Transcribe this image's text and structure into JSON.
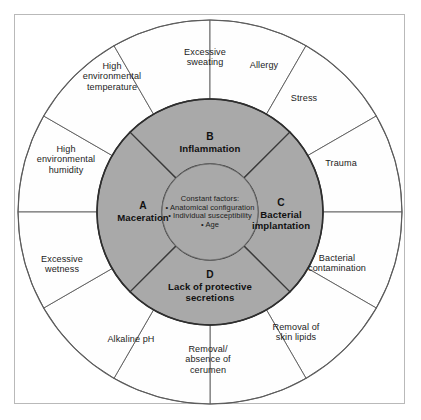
{
  "figure": {
    "type": "concentric-wheel-diagram",
    "colors": {
      "inner_disc_fill": "#a9a9a9",
      "outer_ring_fill": "#fefefe",
      "stroke": "#5b5b5b",
      "inner_stroke": "#2e2e2e",
      "frame": "#b9b9b9",
      "background": "#ffffff",
      "text": "#1c1c1c"
    },
    "geometry": {
      "center_x": 210,
      "center_y": 212,
      "outer_radius": 192,
      "inner_disc_radius": 113,
      "core_radius": 48,
      "outer_segment_count": 12,
      "inner_quadrant_count": 4
    }
  },
  "core": {
    "heading": "Constant factors:",
    "bullets": [
      "• Anatomical configuration",
      "• Individual susceptibility",
      "• Age"
    ]
  },
  "quadrants": [
    {
      "letter": "A",
      "label": "Maceration",
      "position": "left",
      "center_angle_deg": 180,
      "label_x": 143,
      "label_y": 212
    },
    {
      "letter": "B",
      "label": "Inflammation",
      "position": "top",
      "center_angle_deg": 270,
      "label_x": 210,
      "label_y": 143
    },
    {
      "letter": "C",
      "label": "Bacterial implantation",
      "position": "right",
      "center_angle_deg": 0,
      "label_x": 281,
      "label_y": 214
    },
    {
      "letter": "D",
      "label": "Lack of protective secretions",
      "position": "bottom",
      "center_angle_deg": 90,
      "label_x": 210,
      "label_y": 286
    }
  ],
  "outer_segments": [
    {
      "label": "Excessive sweating",
      "index": 0,
      "label_x": 205,
      "label_y": 57,
      "width": 62
    },
    {
      "label": "Allergy",
      "index": 1,
      "label_x": 264,
      "label_y": 65,
      "width": 50
    },
    {
      "label": "Stress",
      "index": 2,
      "label_x": 304,
      "label_y": 98,
      "width": 44
    },
    {
      "label": "Trauma",
      "index": 3,
      "label_x": 341,
      "label_y": 163,
      "width": 52
    },
    {
      "label": "Bacterial contamination",
      "index": 4,
      "label_x": 337,
      "label_y": 263,
      "width": 70
    },
    {
      "label": "Removal of skin lipids",
      "index": 5,
      "label_x": 296,
      "label_y": 332,
      "width": 62
    },
    {
      "label": "Removal/ absence of cerumen",
      "index": 6,
      "label_x": 208,
      "label_y": 360,
      "width": 62
    },
    {
      "label": "Alkaline pH",
      "index": 7,
      "label_x": 131,
      "label_y": 339,
      "width": 56
    },
    {
      "label": "Excessive wetness",
      "index": 8,
      "label_x": 62,
      "label_y": 264,
      "width": 60
    },
    {
      "label": "High environmental humidity",
      "index": 9,
      "label_x": 66,
      "label_y": 160,
      "width": 70
    },
    {
      "label": "High environmental temperature",
      "index": 10,
      "label_x": 112,
      "label_y": 77,
      "width": 68
    }
  ]
}
